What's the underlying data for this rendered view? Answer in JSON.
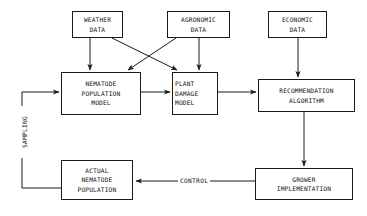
{
  "diagram": {
    "background_color": "#ffffff",
    "line_color": "#1a1a1a",
    "text_color": "#111111",
    "nodes": [
      {
        "id": "weather-data",
        "label": "WEATHER\nDATA",
        "lines": [
          "WEATHER",
          "DATA"
        ],
        "align": "center"
      },
      {
        "id": "agronomic-data",
        "label": "AGRONOMIC\nDATA",
        "lines": [
          "AGRONOMIC",
          "DATA"
        ],
        "align": "center"
      },
      {
        "id": "economic-data",
        "label": "ECONOMIC\nDATA",
        "lines": [
          "ECONOMIC",
          "DATA"
        ],
        "align": "center"
      },
      {
        "id": "nematode-population-model",
        "label": "NEMATODE\nPOPULATION\nMODEL",
        "lines": [
          "NEMATODE",
          "POPULATION",
          "MODEL"
        ],
        "align": "center"
      },
      {
        "id": "plant-damage-model",
        "label": "PLANT\nDAMAGE\nMODEL",
        "lines": [
          "PLANT",
          "DAMAGE",
          "MODEL"
        ],
        "align": "left"
      },
      {
        "id": "recommendation-algorithm",
        "label": "RECOMMENDATION\nALGORITHM",
        "lines": [
          "RECOMMENDATION",
          "ALGORITHM"
        ],
        "align": "center"
      },
      {
        "id": "actual-nematode-population",
        "label": "ACTUAL\nNEMATODE\nPOPULATION",
        "lines": [
          "ACTUAL",
          "NEMATODE",
          "POPULATION"
        ],
        "align": "center"
      },
      {
        "id": "grower-implementation",
        "label": "GROWER\nIMPLEMENTATION",
        "lines": [
          "GROWER",
          "IMPLEMENTATION"
        ],
        "align": "center"
      }
    ],
    "edge_labels": {
      "sampling": "SAMPLING",
      "control": "CONTROL"
    },
    "edges": [
      {
        "from": "weather-data",
        "to": "nematode-population-model",
        "style": "arrow"
      },
      {
        "from": "weather-data",
        "to": "plant-damage-model",
        "style": "arrow"
      },
      {
        "from": "agronomic-data",
        "to": "nematode-population-model",
        "style": "arrow"
      },
      {
        "from": "agronomic-data",
        "to": "plant-damage-model",
        "style": "arrow"
      },
      {
        "from": "economic-data",
        "to": "recommendation-algorithm",
        "style": "arrow"
      },
      {
        "from": "nematode-population-model",
        "to": "plant-damage-model",
        "style": "arrow"
      },
      {
        "from": "plant-damage-model",
        "to": "recommendation-algorithm",
        "style": "arrow"
      },
      {
        "from": "recommendation-algorithm",
        "to": "grower-implementation",
        "style": "arrow"
      },
      {
        "from": "grower-implementation",
        "to": "actual-nematode-population",
        "style": "arrow",
        "label": "CONTROL"
      },
      {
        "from": "actual-nematode-population",
        "to": "nematode-population-model",
        "style": "arrow",
        "label": "SAMPLING"
      }
    ]
  }
}
